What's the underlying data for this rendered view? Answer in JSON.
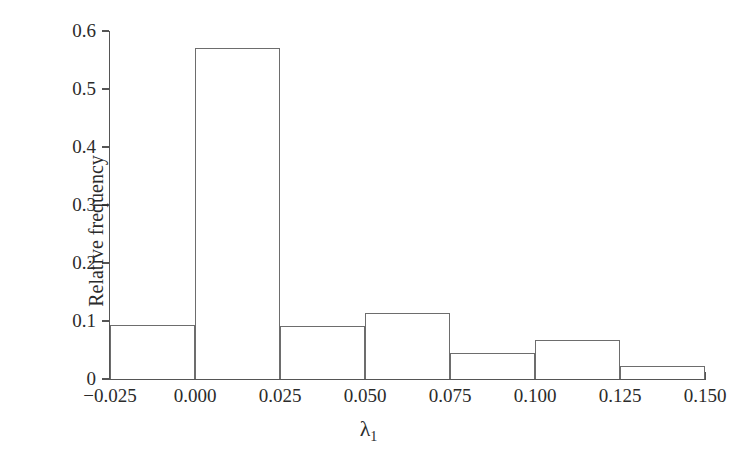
{
  "chart_data": {
    "type": "bar",
    "subtype": "histogram",
    "title": "",
    "xlabel": "λ",
    "xlabel_subscript": "1",
    "ylabel": "Relative frequency",
    "xlim": [
      -0.025,
      0.15
    ],
    "ylim": [
      0,
      0.6
    ],
    "grid": false,
    "legend": null,
    "bin_width": 0.025,
    "bin_edges": [
      -0.025,
      0.0,
      0.025,
      0.05,
      0.075,
      0.1,
      0.125,
      0.15
    ],
    "categories": [
      "-0.025 to 0.000",
      "0.000 to 0.025",
      "0.025 to 0.050",
      "0.050 to 0.075",
      "0.075 to 0.100",
      "0.100 to 0.125",
      "0.125 to 0.150"
    ],
    "values": [
      0.093,
      0.57,
      0.092,
      0.113,
      0.045,
      0.068,
      0.022
    ],
    "xticks": [
      -0.025,
      0.0,
      0.025,
      0.05,
      0.075,
      0.1,
      0.125,
      0.15
    ],
    "xticklabels": [
      "−0.025",
      "0.000",
      "0.025",
      "0.050",
      "0.075",
      "0.100",
      "0.125",
      "0.150"
    ],
    "yticks": [
      0,
      0.1,
      0.2,
      0.3,
      0.4,
      0.5,
      0.6
    ],
    "yticklabels": [
      "0",
      "0.1",
      "0.2",
      "0.3",
      "0.4",
      "0.5",
      "0.6"
    ],
    "colors": {
      "bar_fill": "#ffffff",
      "bar_stroke": "#6d6d6d",
      "axis": "#555555",
      "text": "#2b2b2b",
      "background": "#ffffff"
    }
  }
}
